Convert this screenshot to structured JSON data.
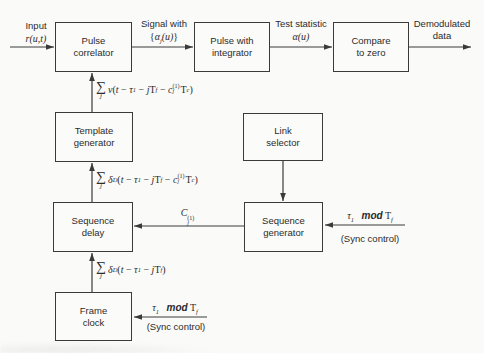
{
  "diagram": {
    "colors": {
      "ink": "#3a3a3a",
      "background": "#fafaf8"
    },
    "blocks": {
      "pulse_correlator": {
        "line1": "Pulse",
        "line2": "correlator"
      },
      "pulse_integrator": {
        "line1": "Pulse with",
        "line2": "integrator"
      },
      "compare_zero": {
        "line1": "Compare",
        "line2": "to zero"
      },
      "template_generator": {
        "line1": "Template",
        "line2": "generator"
      },
      "link_selector": {
        "line1": "Link",
        "line2": "selector"
      },
      "sequence_delay": {
        "line1": "Sequence",
        "line2": "delay"
      },
      "sequence_generator": {
        "line1": "Sequence",
        "line2": "generator"
      },
      "frame_clock": {
        "line1": "Frame",
        "line2": "clock"
      }
    },
    "flow_labels": {
      "input_title": "Input",
      "signal_title": "Signal with",
      "test_title": "Test statistic",
      "output_line1": "Demodulated",
      "output_line2": "data",
      "sync_control": "(Sync control)"
    },
    "formulas": {
      "input_signal": [
        {
          "s": "it",
          "t": "r(u,t)"
        }
      ],
      "alpha_set": [
        {
          "s": "rm",
          "t": "{"
        },
        {
          "s": "it",
          "t": "α"
        },
        {
          "s": "sub",
          "t": "j"
        },
        {
          "s": "it",
          "t": "(u)"
        },
        {
          "s": "rm",
          "t": "}"
        }
      ],
      "alpha_u": [
        {
          "s": "it",
          "t": "α(u)"
        }
      ],
      "template_v": [
        {
          "s": "sum",
          "t": "∑",
          "sub": "j"
        },
        {
          "s": "it",
          "t": "v"
        },
        {
          "s": "rm",
          "t": "("
        },
        {
          "s": "it",
          "t": "t"
        },
        {
          "s": "rm",
          "t": " − "
        },
        {
          "s": "it",
          "t": "τ"
        },
        {
          "s": "sub",
          "t": "1"
        },
        {
          "s": "rm",
          "t": " − "
        },
        {
          "s": "it",
          "t": "j"
        },
        {
          "s": "rm",
          "t": "T"
        },
        {
          "s": "sub",
          "t": "f"
        },
        {
          "s": "rm",
          "t": " − "
        },
        {
          "s": "it",
          "t": "c"
        },
        {
          "s": "ss",
          "sub": "j",
          "sup": "(1)"
        },
        {
          "s": "rm",
          "t": "T"
        },
        {
          "s": "sub",
          "t": "c"
        },
        {
          "s": "rm",
          "t": ")"
        }
      ],
      "delta_coded": [
        {
          "s": "sum",
          "t": "∑",
          "sub": "j"
        },
        {
          "s": "it",
          "t": "δ"
        },
        {
          "s": "sub",
          "t": "D"
        },
        {
          "s": "rm",
          "t": "("
        },
        {
          "s": "it",
          "t": "t"
        },
        {
          "s": "rm",
          "t": " − "
        },
        {
          "s": "it",
          "t": "τ"
        },
        {
          "s": "sub",
          "t": "1"
        },
        {
          "s": "rm",
          "t": " − "
        },
        {
          "s": "it",
          "t": "j"
        },
        {
          "s": "rm",
          "t": "T"
        },
        {
          "s": "sub",
          "t": "f"
        },
        {
          "s": "rm",
          "t": " − "
        },
        {
          "s": "it",
          "t": "c"
        },
        {
          "s": "ss",
          "sub": "j",
          "sup": "(1)"
        },
        {
          "s": "rm",
          "t": "T"
        },
        {
          "s": "sub",
          "t": "c"
        },
        {
          "s": "rm",
          "t": ")"
        }
      ],
      "delta_frame": [
        {
          "s": "sum",
          "t": "∑",
          "sub": "j"
        },
        {
          "s": "it",
          "t": "δ"
        },
        {
          "s": "sub",
          "t": "D"
        },
        {
          "s": "rm",
          "t": "("
        },
        {
          "s": "it",
          "t": "t"
        },
        {
          "s": "rm",
          "t": " − "
        },
        {
          "s": "it",
          "t": "τ"
        },
        {
          "s": "sub",
          "t": "1"
        },
        {
          "s": "rm",
          "t": " − "
        },
        {
          "s": "it",
          "t": "j"
        },
        {
          "s": "rm",
          "t": "T"
        },
        {
          "s": "sub",
          "t": "f"
        },
        {
          "s": "rm",
          "t": ")"
        }
      ],
      "code_cj": [
        {
          "s": "it",
          "t": "C"
        },
        {
          "s": "ss",
          "sub": "j",
          "sup": "(1)"
        }
      ],
      "sync_tau": [
        {
          "s": "it",
          "t": "τ"
        },
        {
          "s": "sub",
          "t": "1"
        },
        {
          "s": "rm",
          "t": "   "
        },
        {
          "s": "bi",
          "t": "mod"
        },
        {
          "s": "rm",
          "t": " T"
        },
        {
          "s": "sub",
          "t": "f"
        }
      ]
    }
  }
}
